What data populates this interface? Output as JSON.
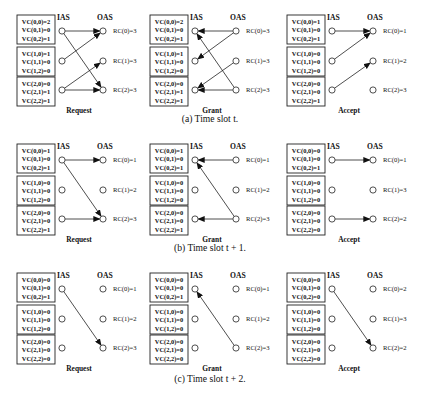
{
  "figure": {
    "rows": [
      {
        "caption": "(a) Time slot t.",
        "panels": [
          {
            "title": "Request",
            "ias_label": "IAS",
            "oas_label": "OAS",
            "vc_groups": [
              [
                "VC(0,0)=2",
                "VC(0,1)=0",
                "VC(0,2)=1"
              ],
              [
                "VC(1,0)=1",
                "VC(1,1)=0",
                "VC(1,2)=0"
              ],
              [
                "VC(2,0)=0",
                "VC(2,1)=1",
                "VC(2,2)=1"
              ]
            ],
            "rc_labels": [
              "RC(0)=3",
              "RC(1)=3",
              "RC(2)=3"
            ],
            "direction": "ias_to_oas",
            "edges": [
              [
                0,
                0
              ],
              [
                0,
                2
              ],
              [
                1,
                0
              ],
              [
                2,
                1
              ],
              [
                2,
                2
              ]
            ]
          },
          {
            "title": "Grant",
            "ias_label": "IAS",
            "oas_label": "OAS",
            "vc_groups": [
              [
                "VC(0,0)=2",
                "VC(0,1)=0",
                "VC(0,2)=1"
              ],
              [
                "VC(1,0)=1",
                "VC(1,1)=0",
                "VC(1,2)=0"
              ],
              [
                "VC(2,0)=0",
                "VC(2,1)=1",
                "VC(2,2)=1"
              ]
            ],
            "rc_labels": [
              "RC(0)=3",
              "RC(1)=3",
              "RC(2)=3"
            ],
            "direction": "oas_to_ias",
            "edges": [
              [
                0,
                0
              ],
              [
                1,
                0
              ],
              [
                2,
                1
              ],
              [
                0,
                2
              ],
              [
                2,
                2
              ]
            ]
          },
          {
            "title": "Accept",
            "ias_label": "IAS",
            "oas_label": "OAS",
            "vc_groups": [
              [
                "VC(0,0)=1",
                "VC(0,1)=0",
                "VC(0,2)=1"
              ],
              [
                "VC(1,0)=0",
                "VC(1,1)=0",
                "VC(1,2)=0"
              ],
              [
                "VC(2,0)=0",
                "VC(2,1)=0",
                "VC(2,2)=1"
              ]
            ],
            "rc_labels": [
              "RC(0)=1",
              "RC(1)=2",
              "RC(2)=3"
            ],
            "direction": "ias_to_oas",
            "edges": [
              [
                0,
                0
              ],
              [
                1,
                0
              ],
              [
                2,
                1
              ]
            ]
          }
        ]
      },
      {
        "caption": "(b) Time slot t + 1.",
        "panels": [
          {
            "title": "Request",
            "ias_label": "IAS",
            "oas_label": "OAS",
            "vc_groups": [
              [
                "VC(0,0)=1",
                "VC(0,1)=0",
                "VC(0,2)=1"
              ],
              [
                "VC(1,0)=0",
                "VC(1,1)=0",
                "VC(1,2)=0"
              ],
              [
                "VC(2,0)=0",
                "VC(2,1)=0",
                "VC(2,2)=1"
              ]
            ],
            "rc_labels": [
              "RC(0)=1",
              "RC(1)=2",
              "RC(2)=3"
            ],
            "direction": "ias_to_oas",
            "edges": [
              [
                0,
                0
              ],
              [
                0,
                2
              ],
              [
                2,
                2
              ]
            ]
          },
          {
            "title": "Grant",
            "ias_label": "IAS",
            "oas_label": "OAS",
            "vc_groups": [
              [
                "VC(0,0)=1",
                "VC(0,1)=0",
                "VC(0,2)=1"
              ],
              [
                "VC(1,0)=0",
                "VC(1,1)=0",
                "VC(1,2)=0"
              ],
              [
                "VC(2,0)=0",
                "VC(2,1)=0",
                "VC(2,2)=1"
              ]
            ],
            "rc_labels": [
              "RC(0)=1",
              "RC(1)=2",
              "RC(2)=3"
            ],
            "direction": "oas_to_ias",
            "edges": [
              [
                0,
                0
              ],
              [
                0,
                2
              ],
              [
                2,
                2
              ]
            ]
          },
          {
            "title": "Accept",
            "ias_label": "IAS",
            "oas_label": "OAS",
            "vc_groups": [
              [
                "VC(0,0)=0",
                "VC(0,1)=0",
                "VC(0,2)=1"
              ],
              [
                "VC(1,0)=0",
                "VC(1,1)=0",
                "VC(1,2)=0"
              ],
              [
                "VC(2,0)=0",
                "VC(2,1)=0",
                "VC(2,2)=0"
              ]
            ],
            "rc_labels": [
              "RC(0)=1",
              "RC(1)=3",
              "RC(2)=2"
            ],
            "direction": "ias_to_oas",
            "edges": [
              [
                0,
                0
              ],
              [
                2,
                2
              ]
            ]
          }
        ]
      },
      {
        "caption": "(c) Time slot t + 2.",
        "panels": [
          {
            "title": "Request",
            "ias_label": "IAS",
            "oas_label": "OAS",
            "vc_groups": [
              [
                "VC(0,0)=0",
                "VC(0,1)=0",
                "VC(0,2)=1"
              ],
              [
                "VC(1,0)=0",
                "VC(1,1)=0",
                "VC(1,2)=0"
              ],
              [
                "VC(2,0)=0",
                "VC(2,1)=0",
                "VC(2,2)=0"
              ]
            ],
            "rc_labels": [
              "RC(0)=1",
              "RC(1)=2",
              "RC(2)=3"
            ],
            "direction": "ias_to_oas",
            "edges": [
              [
                0,
                2
              ]
            ]
          },
          {
            "title": "Grant",
            "ias_label": "IAS",
            "oas_label": "OAS",
            "vc_groups": [
              [
                "VC(0,0)=0",
                "VC(0,1)=0",
                "VC(0,2)=1"
              ],
              [
                "VC(1,0)=0",
                "VC(1,1)=0",
                "VC(1,2)=0"
              ],
              [
                "VC(2,0)=0",
                "VC(2,1)=0",
                "VC(2,2)=0"
              ]
            ],
            "rc_labels": [
              "RC(0)=1",
              "RC(1)=2",
              "RC(2)=3"
            ],
            "direction": "oas_to_ias",
            "edges": [
              [
                0,
                2
              ]
            ]
          },
          {
            "title": "Accept",
            "ias_label": "IAS",
            "oas_label": "OAS",
            "vc_groups": [
              [
                "VC(0,0)=0",
                "VC(0,1)=0",
                "VC(0,2)=0"
              ],
              [
                "VC(1,0)=0",
                "VC(1,1)=0",
                "VC(1,2)=0"
              ],
              [
                "VC(2,0)=0",
                "VC(2,1)=0",
                "VC(2,2)=0"
              ]
            ],
            "rc_labels": [
              "RC(0)=2",
              "RC(1)=3",
              "RC(2)=2"
            ],
            "direction": "ias_to_oas",
            "edges": [
              [
                0,
                2
              ]
            ]
          }
        ]
      }
    ]
  }
}
